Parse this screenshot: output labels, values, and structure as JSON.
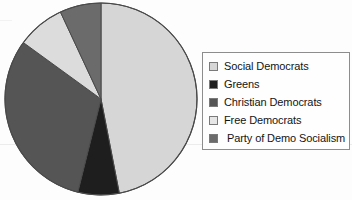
{
  "chart_data": {
    "type": "pie",
    "title": "",
    "legend_position": "right",
    "categories": [
      "Social Democrats",
      "Greens",
      "Christian Democrats",
      "Free Democrats",
      "Party of Demo Socialism"
    ],
    "values": [
      47,
      7,
      31,
      8,
      7
    ],
    "unit": "percent",
    "start_angle_deg": 0,
    "direction": "clockwise",
    "slices": [
      {
        "label": "Social Democrats",
        "value": 47,
        "color": "#d6d6d6",
        "start_deg": 0,
        "end_deg": 169
      },
      {
        "label": "Greens",
        "value": 7,
        "color": "#1e1e1e",
        "start_deg": 169,
        "end_deg": 194
      },
      {
        "label": "Christian Democrats",
        "value": 31,
        "color": "#555555",
        "start_deg": 194,
        "end_deg": 306
      },
      {
        "label": "Free Democrats",
        "value": 8,
        "color": "#dcdcdc",
        "start_deg": 306,
        "end_deg": 335
      },
      {
        "label": "Party of Demo Socialism",
        "value": 7,
        "color": "#6b6b6b",
        "start_deg": 335,
        "end_deg": 360
      }
    ],
    "outline_color": "#4a4a4a"
  },
  "legend": {
    "items": [
      {
        "label": "Social Democrats",
        "color": "#d6d6d6"
      },
      {
        "label": "Greens",
        "color": "#1e1e1e"
      },
      {
        "label": "Christian Democrats",
        "color": "#555555"
      },
      {
        "label": "Free Democrats",
        "color": "#e6e6e6"
      },
      {
        "label": "Party of Demo Socialism",
        "color": "#6b6b6b"
      }
    ]
  }
}
